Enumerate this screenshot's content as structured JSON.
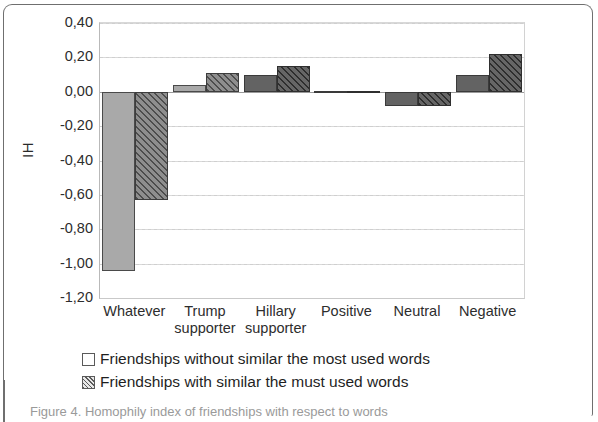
{
  "figure": {
    "caption_fragment": "Figure 4. Homophily index of friendships with respect to words"
  },
  "legend": {
    "position": "below-plot",
    "entries": [
      {
        "swatch": "open-square-swatch",
        "label": "Friendships without similar the most used words"
      },
      {
        "swatch": "hatched-square-swatch",
        "label": "Friendships with similar the must used words"
      }
    ]
  },
  "chart_data": {
    "type": "bar",
    "title": "",
    "xlabel": "",
    "ylabel": "IH",
    "ylim": [
      -1.2,
      0.4
    ],
    "ytick_step": 0.2,
    "grid": true,
    "ytick_labels": [
      "0,40",
      "0,20",
      "0,00",
      "-0,20",
      "-0,40",
      "-0,60",
      "-0,80",
      "-1,00",
      "-1,20"
    ],
    "ytick_values": [
      0.4,
      0.2,
      0.0,
      -0.2,
      -0.4,
      -0.6,
      -0.8,
      -1.0,
      -1.2
    ],
    "categories": [
      "Whatever",
      "Trump supporter",
      "Hillary supporter",
      "Positive",
      "Neutral",
      "Negative"
    ],
    "category_lines": [
      [
        "Whatever"
      ],
      [
        "Trump",
        "supporter"
      ],
      [
        "Hillary",
        "supporter"
      ],
      [
        "Positive"
      ],
      [
        "Neutral"
      ],
      [
        "Negative"
      ]
    ],
    "series": [
      {
        "name": "Friendships without similar the most used words",
        "style": "plain",
        "values": [
          -1.04,
          0.04,
          0.1,
          0.005,
          -0.08,
          0.1
        ]
      },
      {
        "name": "Friendships with similar the must used words",
        "style": "hatched",
        "values": [
          -0.63,
          0.11,
          0.15,
          0.005,
          -0.08,
          0.22
        ]
      }
    ]
  },
  "colors": {
    "series_1_fill": "#a9a9a9",
    "series_2_fill": "#8e8e8e",
    "series_1_dark_fill": "#636363",
    "axis": "#9a9a9a",
    "grid": "#cfcfcf",
    "text": "#1f1f1f"
  }
}
